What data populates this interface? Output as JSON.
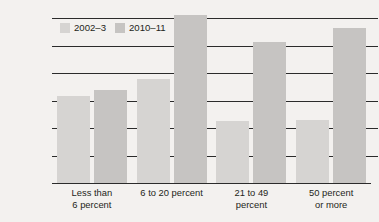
{
  "chart_data": {
    "type": "bar",
    "title": "",
    "subtitle": "",
    "xlabel": "",
    "ylabel": "",
    "ylim": [
      0,
      600000
    ],
    "grid": true,
    "legend_position": "top-left",
    "categories": [
      "Less than\n6 percent",
      "6 to 20 percent",
      "21 to 49\npercent",
      "50 percent\nor more"
    ],
    "ticks": [
      "0",
      "100,000",
      "200,000",
      "300,000",
      "400,000",
      "500,000",
      "600,000"
    ],
    "tick_values": [
      0,
      100000,
      200000,
      300000,
      400000,
      500000,
      600000
    ],
    "series": [
      {
        "name": "2002–3",
        "color": "#d6d4d2",
        "values": [
          315000,
          380000,
          225000,
          228000
        ]
      },
      {
        "name": "2010–11",
        "color": "#c6c4c2",
        "values": [
          338000,
          610000,
          512000,
          562000
        ]
      }
    ]
  },
  "colors": {
    "background": "#f3f1ef",
    "axis": "#2b2b2b",
    "text": "#231f20",
    "series_2002_3": "#d6d4d2",
    "series_2010_11": "#c6c4c2"
  }
}
